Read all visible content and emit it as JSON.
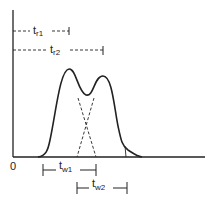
{
  "diagram": {
    "title": "",
    "origin_label": "0",
    "retention_times": [
      {
        "symbol": "t",
        "subscript": "r1"
      },
      {
        "symbol": "t",
        "subscript": "r2"
      }
    ],
    "peak_widths": [
      {
        "symbol": "t",
        "subscript": "w1"
      },
      {
        "symbol": "t",
        "subscript": "w2"
      }
    ],
    "line_color": "#222222"
  }
}
